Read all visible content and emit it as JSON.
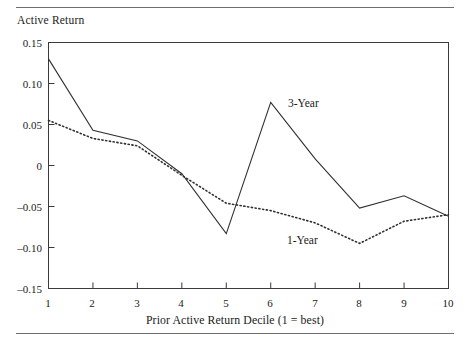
{
  "figure": {
    "rules": [
      "top-rule",
      "bottom-rule"
    ]
  },
  "chart_data": {
    "type": "line",
    "title": "",
    "ylabel": "Active Return",
    "xlabel": "Prior Active Return Decile (1 = best)",
    "categories": [
      1,
      2,
      3,
      4,
      5,
      6,
      7,
      8,
      9,
      10
    ],
    "x": [
      1,
      2,
      3,
      4,
      5,
      6,
      7,
      8,
      9,
      10
    ],
    "xtick_labels": [
      "1",
      "2",
      "3",
      "4",
      "5",
      "6",
      "7",
      "8",
      "9",
      "10"
    ],
    "ytick_labels": [
      "0.15",
      "0.10",
      "0.05",
      "0",
      "–0.05",
      "–0.10",
      "–0.15"
    ],
    "ytick_values": [
      0.15,
      0.1,
      0.05,
      0,
      -0.05,
      -0.1,
      -0.15
    ],
    "ylim": [
      -0.15,
      0.15
    ],
    "xlim": [
      1,
      10
    ],
    "grid": false,
    "legend_position": "inline-annotation",
    "series": [
      {
        "name": "3-Year",
        "style": "solid",
        "color": "#303030",
        "values": [
          0.13,
          0.043,
          0.03,
          -0.01,
          -0.083,
          0.077,
          0.008,
          -0.052,
          -0.037,
          -0.062
        ]
      },
      {
        "name": "1-Year",
        "style": "dotted",
        "color": "#303030",
        "values": [
          0.055,
          0.033,
          0.024,
          -0.012,
          -0.046,
          -0.055,
          -0.07,
          -0.095,
          -0.068,
          -0.06
        ]
      }
    ],
    "annotations": [
      {
        "text": "3-Year",
        "x": 6.5,
        "y": 0.078
      },
      {
        "text": "1-Year",
        "x": 6.4,
        "y": -0.085
      }
    ]
  }
}
